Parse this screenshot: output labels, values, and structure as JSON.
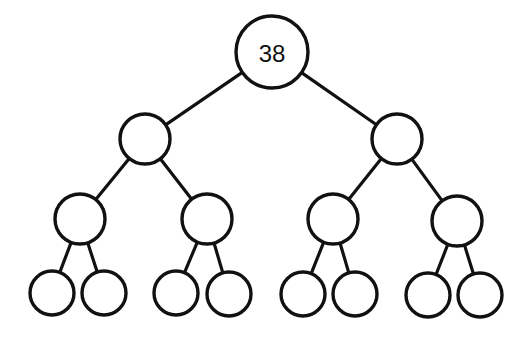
{
  "diagram": {
    "type": "binary-tree",
    "levels": 4,
    "colors": {
      "stroke": "#111111",
      "fill": "#ffffff",
      "background": "#ffffff"
    },
    "nodes": [
      {
        "id": "n1",
        "label": "38",
        "level": 0,
        "cx": 272,
        "cy": 52,
        "r": 36
      },
      {
        "id": "n2",
        "label": "",
        "level": 1,
        "cx": 145,
        "cy": 139,
        "r": 25
      },
      {
        "id": "n3",
        "label": "",
        "level": 1,
        "cx": 397,
        "cy": 139,
        "r": 25
      },
      {
        "id": "n4",
        "label": "",
        "level": 2,
        "cx": 80,
        "cy": 219,
        "r": 25
      },
      {
        "id": "n5",
        "label": "",
        "level": 2,
        "cx": 207,
        "cy": 219,
        "r": 25
      },
      {
        "id": "n6",
        "label": "",
        "level": 2,
        "cx": 333,
        "cy": 219,
        "r": 25
      },
      {
        "id": "n7",
        "label": "",
        "level": 2,
        "cx": 457,
        "cy": 221,
        "r": 25
      },
      {
        "id": "n8",
        "label": "",
        "level": 3,
        "cx": 52,
        "cy": 293,
        "r": 22
      },
      {
        "id": "n9",
        "label": "",
        "level": 3,
        "cx": 104,
        "cy": 293,
        "r": 22
      },
      {
        "id": "n10",
        "label": "",
        "level": 3,
        "cx": 176,
        "cy": 293,
        "r": 22
      },
      {
        "id": "n11",
        "label": "",
        "level": 3,
        "cx": 229,
        "cy": 294,
        "r": 22
      },
      {
        "id": "n12",
        "label": "",
        "level": 3,
        "cx": 303,
        "cy": 294,
        "r": 22
      },
      {
        "id": "n13",
        "label": "",
        "level": 3,
        "cx": 355,
        "cy": 294,
        "r": 22
      },
      {
        "id": "n14",
        "label": "",
        "level": 3,
        "cx": 428,
        "cy": 295,
        "r": 22
      },
      {
        "id": "n15",
        "label": "",
        "level": 3,
        "cx": 480,
        "cy": 295,
        "r": 22
      }
    ],
    "edges": [
      [
        "n1",
        "n2"
      ],
      [
        "n1",
        "n3"
      ],
      [
        "n2",
        "n4"
      ],
      [
        "n2",
        "n5"
      ],
      [
        "n3",
        "n6"
      ],
      [
        "n3",
        "n7"
      ],
      [
        "n4",
        "n8"
      ],
      [
        "n4",
        "n9"
      ],
      [
        "n5",
        "n10"
      ],
      [
        "n5",
        "n11"
      ],
      [
        "n6",
        "n12"
      ],
      [
        "n6",
        "n13"
      ],
      [
        "n7",
        "n14"
      ],
      [
        "n7",
        "n15"
      ]
    ]
  }
}
